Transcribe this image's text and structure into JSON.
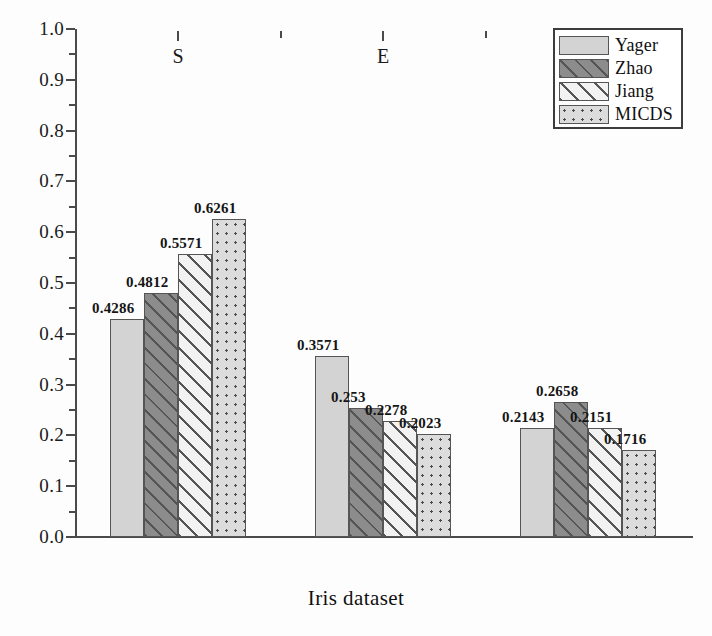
{
  "chart_data": {
    "type": "bar",
    "title": "",
    "xlabel": "Iris dataset",
    "ylabel": "",
    "categories": [
      "S",
      "E",
      "V"
    ],
    "ylim": [
      0.0,
      1.0
    ],
    "ytick_labels": [
      "0.0",
      "0.1",
      "0.2",
      "0.3",
      "0.4",
      "0.5",
      "0.6",
      "0.7",
      "0.8",
      "0.9",
      "1.0"
    ],
    "ytick_values": [
      0.0,
      0.1,
      0.2,
      0.3,
      0.4,
      0.5,
      0.6,
      0.7,
      0.8,
      0.9,
      1.0
    ],
    "grid": false,
    "legend_position": "top-right",
    "series": [
      {
        "name": "Yager",
        "pattern": "solid-gray",
        "values": [
          0.4286,
          0.3571,
          0.2143
        ],
        "labels": [
          "0.4286",
          "0.3571",
          "0.2143"
        ]
      },
      {
        "name": "Zhao",
        "pattern": "dark-hatch",
        "values": [
          0.4812,
          0.253,
          0.2658
        ],
        "labels": [
          "0.4812",
          "0.253",
          "0.2658"
        ]
      },
      {
        "name": "Jiang",
        "pattern": "light-hatch",
        "values": [
          0.5571,
          0.2278,
          0.2151
        ],
        "labels": [
          "0.5571",
          "0.2278",
          "0.2151"
        ]
      },
      {
        "name": "MICDS",
        "pattern": "dotted",
        "values": [
          0.6261,
          0.2023,
          0.1716
        ],
        "labels": [
          "0.6261",
          "0.2023",
          "0.1716"
        ]
      }
    ]
  },
  "colors": {
    "axis": "#4a4a4a",
    "text": "#101010",
    "yager_fill": "#d3d3d3",
    "zhao_fill": "#8c8c8c",
    "jiang_fill": "#f2f2f2",
    "micds_fill": "#dcdcdc",
    "bar_edge": "#555555"
  },
  "legend": {
    "items": [
      {
        "label": "Yager",
        "pattern": "solid-gray"
      },
      {
        "label": "Zhao",
        "pattern": "dark-hatch"
      },
      {
        "label": "Jiang",
        "pattern": "light-hatch"
      },
      {
        "label": "MICDS",
        "pattern": "dotted"
      }
    ]
  }
}
